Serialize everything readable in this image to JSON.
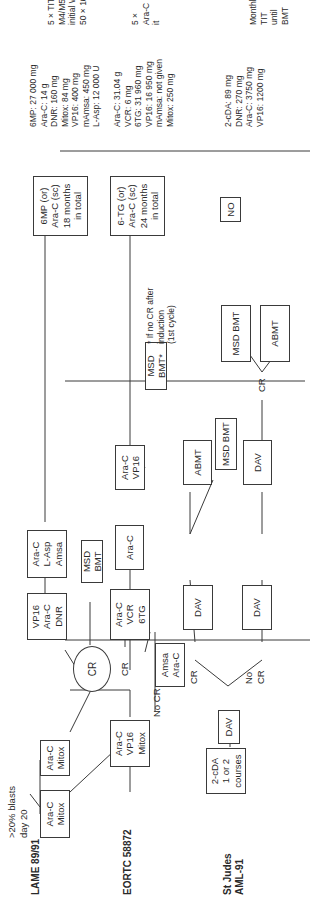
{
  "protocols": [
    {
      "name": "LAME 89/91"
    },
    {
      "name": "EORTC 58872"
    },
    {
      "name": "St Judes\nAML-91"
    }
  ],
  "lame": {
    "note": ">20% blasts\nday 20",
    "induction1": "Ara-C\nMitox",
    "induction2": "Ara-C\nMitox",
    "cr": "CR",
    "consolidation1": "VP16\nAra-C\nDNR",
    "consolidation2": "Ara-C\nL-Asp\nAmsa",
    "msd_bmt": "MSD BMT",
    "maintenance": "6MP (or)\nAra-C (sc)\n18 months\nin total",
    "doses": "6MP: 27 000 mg\nAra-C: 14 g\nDNR: 160 mg\nMitox: 84 mg\nVP16: 400 mg\nmAmsa: 450 mg\nL-Asp: 12 000 U",
    "cns": "5 × TIT only in\nM4/M5 cases or\ninitial WBC >\n50 × 10⁹/L"
  },
  "eortc": {
    "induction": "Ara-C\nVP16\nMitox",
    "no_cr": "No CR",
    "cr": "CR",
    "salvage": "Amsa\nAra-C",
    "consolidation1": "Ara-C\nVCR\n6TG",
    "consolidation2": "Ara-C",
    "consolidation3": "Ara-C\nVP16",
    "msd_bmt": "MSD BMT*",
    "footnote": "* If no CR after\ninduction\n(1st cycle)",
    "maintenance": "6-TG (or)\nAra-C (sc)\n24 months\nin total",
    "doses": "Ara-C: 31.04 g\nVCR: 6 mg\n6TG: 31 960 mg\nVP16: 16 950 mg\nmAmsa: not given\nMitox: 250 mg",
    "cns": "5 × Ara-C it"
  },
  "stjude": {
    "window": "2-cDA\n1 or 2\ncourses",
    "induction": "DAV",
    "cr": "CR",
    "no_cr": "No\nCR",
    "dav_cr": "DAV",
    "dav_nocr": "DAV",
    "abmt": "ABMT",
    "msd_bmt": "MSD BMT",
    "dav3": "DAV",
    "cr2": "CR",
    "msd_bmt2": "MSD BMT",
    "abmt2": "ABMT",
    "maintenance": "NO",
    "doses": "2-cDA: 89 mg\nDNR: 270 mg\nAra-C: 3750 mg\nVP16: 1200 mg",
    "cns": "Monthly TIT\nuntil BMT"
  }
}
